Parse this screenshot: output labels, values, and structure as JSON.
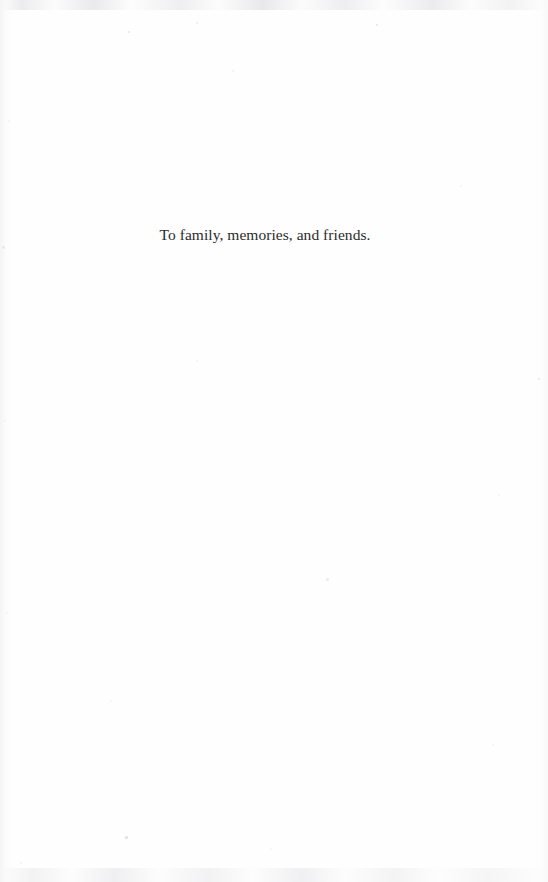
{
  "page": {
    "kind": "book-dedication-page",
    "background_color": "#fefefe",
    "width": 548,
    "height": 882
  },
  "content": {
    "dedication_text": "To family, memories, and friends.",
    "text_color": "#2b2b2b"
  },
  "artifacts": {
    "top_band_label": "scan-band-top",
    "bottom_band_label": "scan-band-bottom",
    "left_edge_label": "scan-edge-left",
    "right_edge_label": "scan-edge-right",
    "specks": [
      {
        "x": 128,
        "y": 31,
        "size": 2.0,
        "color": "rgba(205,205,210,0.55)"
      },
      {
        "x": 376,
        "y": 24,
        "size": 2.4,
        "color": "rgba(200,200,206,0.5)"
      },
      {
        "x": 196,
        "y": 22,
        "size": 1.6,
        "color": "rgba(214,214,218,0.45)"
      },
      {
        "x": 232,
        "y": 70,
        "size": 1.8,
        "color": "rgba(222,222,226,0.4)"
      },
      {
        "x": 8,
        "y": 120,
        "size": 2.2,
        "color": "rgba(226,226,230,0.45)"
      },
      {
        "x": 460,
        "y": 185,
        "size": 1.7,
        "color": "rgba(228,228,232,0.4)"
      },
      {
        "x": 2,
        "y": 246,
        "size": 2.6,
        "color": "rgba(222,222,227,0.5)"
      },
      {
        "x": 196,
        "y": 360,
        "size": 1.9,
        "color": "rgba(229,229,233,0.4)"
      },
      {
        "x": 538,
        "y": 378,
        "size": 2.3,
        "color": "rgba(214,214,219,0.55)"
      },
      {
        "x": 4,
        "y": 420,
        "size": 2.1,
        "color": "rgba(228,228,232,0.42)"
      },
      {
        "x": 498,
        "y": 494,
        "size": 1.8,
        "color": "rgba(230,230,234,0.4)"
      },
      {
        "x": 326,
        "y": 578,
        "size": 2.5,
        "color": "rgba(220,220,225,0.5)"
      },
      {
        "x": 6,
        "y": 612,
        "size": 2.0,
        "color": "rgba(229,229,233,0.4)"
      },
      {
        "x": 110,
        "y": 700,
        "size": 1.7,
        "color": "rgba(232,232,236,0.38)"
      },
      {
        "x": 492,
        "y": 744,
        "size": 1.9,
        "color": "rgba(228,228,232,0.4)"
      },
      {
        "x": 125,
        "y": 836,
        "size": 2.6,
        "color": "rgba(206,206,212,0.6)"
      },
      {
        "x": 270,
        "y": 848,
        "size": 1.8,
        "color": "rgba(228,228,232,0.42)"
      },
      {
        "x": 20,
        "y": 862,
        "size": 2.0,
        "color": "rgba(226,226,231,0.45)"
      }
    ]
  }
}
